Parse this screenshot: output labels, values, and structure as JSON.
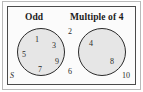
{
  "diagram": {
    "type": "venn-diagram",
    "title_left": "Odd",
    "title_right": "Multiple of 4",
    "universal_set_label": "S",
    "colors": {
      "circle_fill": "#e6e6e6",
      "circle_stroke": "#2b2b2b",
      "rect_stroke": "#4a4a4a",
      "frame_stroke": "#b9b9b9",
      "text": "#2a2a2a"
    },
    "sets": {
      "left": {
        "name": "Odd",
        "elements": [
          {
            "value": "1",
            "x": 35,
            "y": 36
          },
          {
            "value": "3",
            "x": 52,
            "y": 42
          },
          {
            "value": "5",
            "x": 22,
            "y": 51
          },
          {
            "value": "7",
            "x": 38,
            "y": 66
          },
          {
            "value": "9",
            "x": 55,
            "y": 58
          }
        ]
      },
      "right": {
        "name": "Multiple of 4",
        "elements": [
          {
            "value": "4",
            "x": 89,
            "y": 40
          },
          {
            "value": "8",
            "x": 110,
            "y": 58
          }
        ]
      },
      "outside": {
        "name": "Neither",
        "elements": [
          {
            "value": "2",
            "x": 68,
            "y": 28
          },
          {
            "value": "6",
            "x": 68,
            "y": 68
          },
          {
            "value": "10",
            "x": 122,
            "y": 72
          }
        ]
      }
    }
  }
}
